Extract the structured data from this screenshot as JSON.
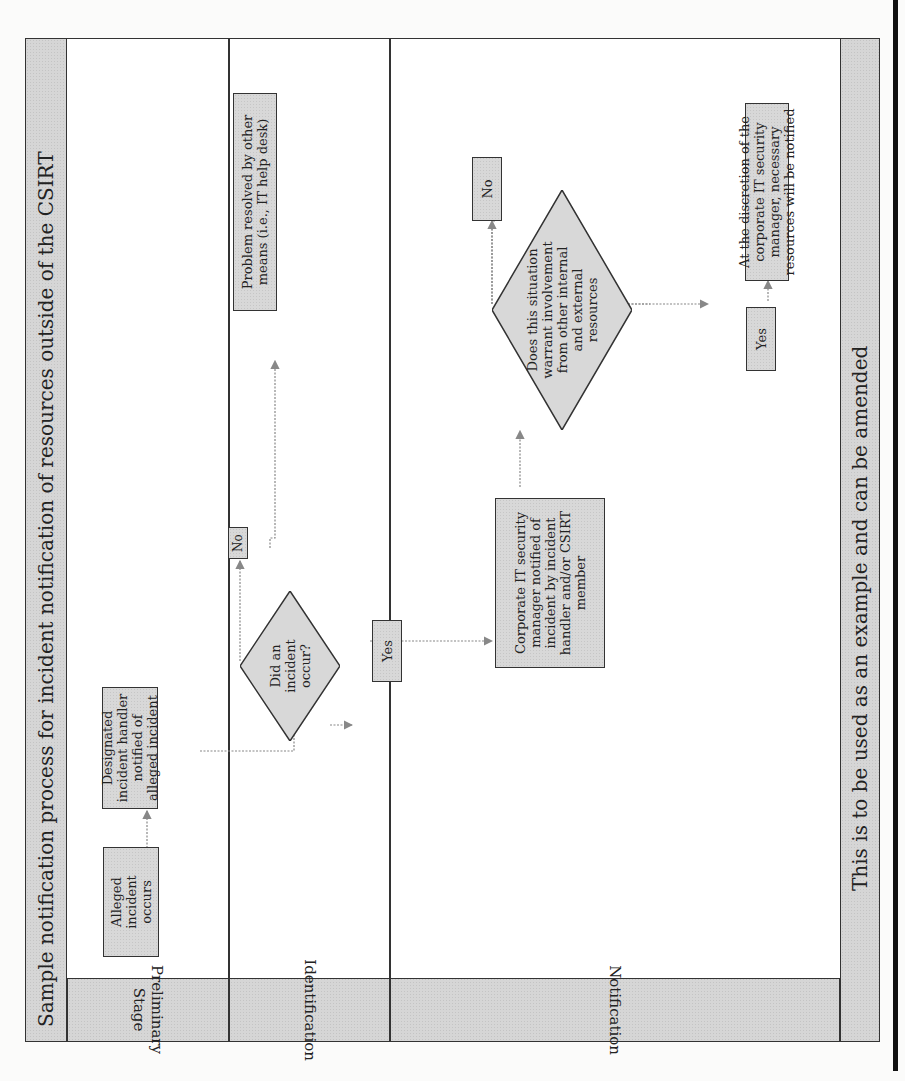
{
  "diagram": {
    "title": "Sample notification process for incident notification of resources outside of the CSIRT",
    "footer": "This is to be used as an example and can be amended",
    "lanes": [
      {
        "label": "Preliminary Stage"
      },
      {
        "label": "Identification"
      },
      {
        "label": "Notification"
      }
    ],
    "nodes": {
      "alleged_incident": "Alleged incident occurs",
      "designated_handler": "Designated incident handler notified of alleged incident",
      "did_incident_occur": "Did an incident occur?",
      "no_1": "No",
      "problem_resolved": "Problem resolved by other means (i.e., IT help desk)",
      "yes_1": "Yes",
      "it_manager_notified": "Corporate IT security manager notified of incident by incident handler and/or CSIRT member",
      "warrant_involvement": "Does this situation warrant involvement from other internal and external resources",
      "no_2": "No",
      "yes_2": "Yes",
      "discretion_notified": "At the discretion of the corporate IT security manager, necessary resources will be notified"
    },
    "colors": {
      "box_fill": "#d8d8d8",
      "border": "#333333",
      "connector": "#888888"
    }
  }
}
